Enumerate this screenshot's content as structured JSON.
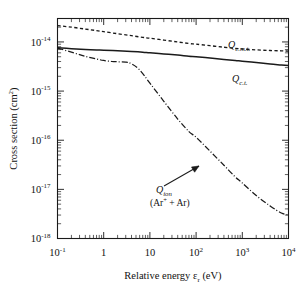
{
  "chart_data": {
    "type": "line",
    "title": "",
    "xlabel": "Relative energy εr (eV)",
    "ylabel": "Cross section  (cm2)",
    "xscale": "log",
    "yscale": "log",
    "xlim": [
      0.1,
      10000
    ],
    "ylim": [
      1e-18,
      3e-14
    ],
    "grid": false,
    "legend_position": "inline-annotations",
    "xticks": [
      "10-1",
      "1",
      "10",
      "102",
      "103",
      "104"
    ],
    "xtick_values": [
      0.1,
      1,
      10,
      100,
      1000,
      10000
    ],
    "yticks": [
      "10-14",
      "10-15",
      "10-16",
      "10-17",
      "10-18"
    ],
    "ytick_values": [
      1e-14,
      1e-15,
      1e-16,
      1e-17,
      1e-18
    ],
    "series": [
      {
        "name": "Qe.m.t.",
        "label": "Q",
        "label_sub": "e.m.t.",
        "style": "dashed",
        "x": [
          0.1,
          0.2,
          0.4,
          0.7,
          1,
          2,
          4,
          7,
          10,
          20,
          40,
          70,
          100,
          200,
          400,
          700,
          1000,
          2000,
          4000,
          7000,
          10000
        ],
        "y": [
          2.15e-14,
          2e-14,
          1.83e-14,
          1.7e-14,
          1.62e-14,
          1.47e-14,
          1.34e-14,
          1.24e-14,
          1.19e-14,
          1.09e-14,
          1e-14,
          9.3e-15,
          9e-15,
          8.4e-15,
          7.8e-15,
          7.4e-15,
          7.2e-15,
          6.9e-15,
          6.7e-15,
          6.6e-15,
          6.5e-15
        ]
      },
      {
        "name": "Qc.t.",
        "label": "Q",
        "label_sub": "c.t.",
        "style": "solid",
        "x": [
          0.1,
          0.2,
          0.4,
          0.7,
          1,
          2,
          4,
          7,
          10,
          20,
          40,
          70,
          100,
          200,
          400,
          700,
          1000,
          2000,
          4000,
          7000,
          10000
        ],
        "y": [
          7.6e-15,
          7.3e-15,
          7e-15,
          6.85e-15,
          6.8e-15,
          6.6e-15,
          6.4e-15,
          6.2e-15,
          6e-15,
          5.7e-15,
          5.4e-15,
          5.1e-15,
          5e-15,
          4.7e-15,
          4.4e-15,
          4.2e-15,
          4.05e-15,
          3.8e-15,
          3.55e-15,
          3.4e-15,
          3.3e-15
        ]
      },
      {
        "name": "Qion",
        "label": "Q",
        "label_sub": "ion",
        "annotation": "(Ar+ + Ar)",
        "annotation_base": "(Ar",
        "annotation_sup": "+",
        "annotation_tail": " + Ar)",
        "style": "dash-dot",
        "x": [
          0.1,
          0.2,
          0.4,
          0.7,
          1,
          1.5,
          2,
          3,
          4,
          6,
          10,
          20,
          40,
          70,
          100,
          200,
          400,
          700,
          1000,
          2000,
          4000,
          7000,
          10000
        ],
        "y": [
          7.5e-15,
          6.2e-15,
          5.1e-15,
          4.5e-15,
          4.2e-15,
          4e-15,
          3.95e-15,
          3.9e-15,
          3.6e-15,
          2.7e-15,
          1.45e-15,
          6.2e-16,
          2.7e-16,
          1.5e-16,
          1.15e-16,
          6e-17,
          3.1e-17,
          1.8e-17,
          1.35e-17,
          7.5e-18,
          4.6e-18,
          3.3e-18,
          3e-18
        ]
      }
    ]
  },
  "labels": {
    "y_axis_title_base": "Cross section  (cm",
    "y_axis_title_sup": "2",
    "y_axis_title_close": ")",
    "x_axis_title_base": "Relative energy ",
    "x_axis_title_eps": "ε",
    "x_axis_title_sub": "r",
    "x_axis_title_unit": " (eV)"
  },
  "ticks": {
    "x": [
      {
        "text": "10",
        "sup": "-1"
      },
      {
        "text": "1",
        "sup": ""
      },
      {
        "text": "10",
        "sup": ""
      },
      {
        "text": "10",
        "sup": "2"
      },
      {
        "text": "10",
        "sup": "3"
      },
      {
        "text": "10",
        "sup": "4"
      }
    ],
    "y": [
      {
        "text": "10",
        "sup": "-14"
      },
      {
        "text": "10",
        "sup": "-15"
      },
      {
        "text": "10",
        "sup": "-16"
      },
      {
        "text": "10",
        "sup": "-17"
      },
      {
        "text": "10",
        "sup": "-18"
      }
    ]
  },
  "colors": {
    "axis": "#1a1a1a",
    "curve": "#1a1a1a",
    "background": "#ffffff"
  }
}
